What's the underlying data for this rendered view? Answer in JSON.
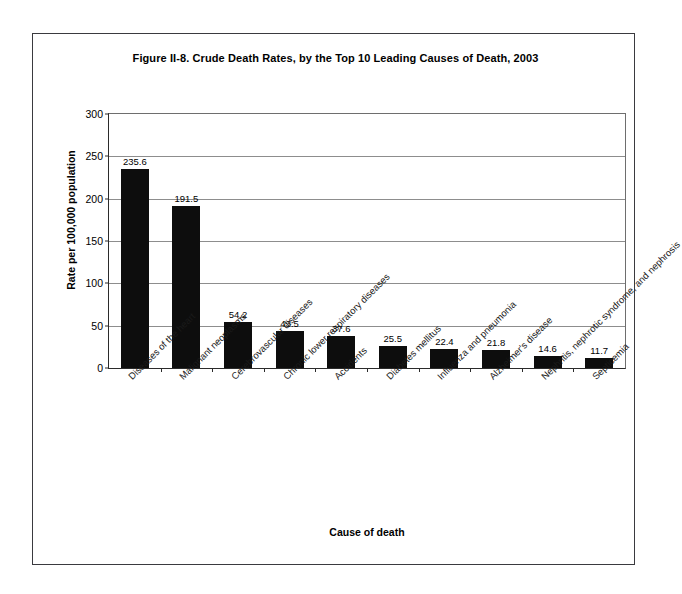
{
  "figure": {
    "title": "Figure II-8. Crude Death Rates, by the Top 10 Leading Causes of Death, 2003"
  },
  "chart_data": {
    "type": "bar",
    "title": "Figure II-8. Crude Death Rates, by the Top 10 Leading Causes of Death, 2003",
    "xlabel": "Cause of death",
    "ylabel": "Rate per 100,000 population",
    "ylim": [
      0,
      300
    ],
    "yticks": [
      0,
      50,
      100,
      150,
      200,
      250,
      300
    ],
    "ytick_labels": [
      "0",
      "50",
      "100",
      "150",
      "200",
      "250",
      "300"
    ],
    "grid": true,
    "legend": false,
    "bar_color": "#0d0d0d",
    "categories": [
      "Diseases of the heart",
      "Malignant neoplasms",
      "Cerebrovascular diseases",
      "Chronic lower respiratory diseases",
      "Accidents",
      "Diabetes mellitus",
      "Influenza and pneumonia",
      "Alzheimer's disease",
      "Nephritis, nephrotic syndrome, and nephrosis",
      "Septicemia"
    ],
    "values": [
      235.6,
      191.5,
      54.2,
      43.5,
      37.6,
      25.5,
      22.4,
      21.8,
      14.6,
      11.7
    ],
    "value_labels": [
      "235.6",
      "191.5",
      "54.2",
      "43.5",
      "37.6",
      "25.5",
      "22.4",
      "21.8",
      "14.6",
      "11.7"
    ]
  }
}
